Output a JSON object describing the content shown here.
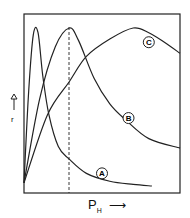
{
  "chart_data": {
    "type": "line",
    "title": "",
    "xlabel": "P_H",
    "ylabel": "r",
    "x_axis_arrow": true,
    "y_axis_arrow": true,
    "ticks": "none",
    "grid": false,
    "reference_line": {
      "style": "dashed",
      "x_fraction": 0.29,
      "description": "vertical dashed line at the maximum of curve B"
    },
    "series": [
      {
        "name": "A",
        "label": "A",
        "description": "sharp early peak, decays to ~0",
        "points": [
          [
            0,
            0.02
          ],
          [
            0.03,
            0.6
          ],
          [
            0.06,
            0.96
          ],
          [
            0.09,
            0.97
          ],
          [
            0.12,
            0.7
          ],
          [
            0.16,
            0.45
          ],
          [
            0.22,
            0.25
          ],
          [
            0.29,
            0.17
          ],
          [
            0.4,
            0.08
          ],
          [
            0.55,
            0.03
          ],
          [
            0.7,
            0.01
          ],
          [
            0.82,
            0.0
          ]
        ]
      },
      {
        "name": "B",
        "label": "B",
        "description": "peak at dashed line, decays slowly",
        "points": [
          [
            0,
            0.02
          ],
          [
            0.1,
            0.55
          ],
          [
            0.2,
            0.88
          ],
          [
            0.29,
            1.0
          ],
          [
            0.35,
            0.92
          ],
          [
            0.45,
            0.68
          ],
          [
            0.55,
            0.52
          ],
          [
            0.65,
            0.42
          ],
          [
            0.8,
            0.3
          ],
          [
            1.0,
            0.24
          ]
        ]
      },
      {
        "name": "C",
        "label": "C",
        "description": "broad late peak",
        "points": [
          [
            0,
            0.02
          ],
          [
            0.15,
            0.45
          ],
          [
            0.29,
            0.66
          ],
          [
            0.4,
            0.82
          ],
          [
            0.55,
            0.93
          ],
          [
            0.7,
            1.0
          ],
          [
            0.8,
            0.97
          ],
          [
            0.9,
            0.91
          ],
          [
            1.0,
            0.84
          ]
        ]
      }
    ],
    "annotations": [
      {
        "text": "A",
        "x": 0.5,
        "y": 0.08
      },
      {
        "text": "B",
        "x": 0.67,
        "y": 0.43
      },
      {
        "text": "C",
        "x": 0.8,
        "y": 0.91
      }
    ]
  },
  "labels": {
    "x_main": "P",
    "x_sub": "H",
    "x_arrow": "⟶",
    "y_main": "r"
  }
}
